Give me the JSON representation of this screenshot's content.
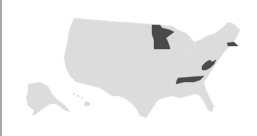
{
  "map": {
    "type": "choropleth",
    "region": "United States",
    "colors": {
      "background": "#ffffff",
      "default_state": "#dcdcdc",
      "highlighted_state": "#4a4a4a",
      "border": "#a8a8a8"
    },
    "highlighted_states": [
      "Minnesota",
      "Massachusetts",
      "West Virginia",
      "Tennessee"
    ],
    "insets": [
      "Alaska",
      "Hawaii"
    ]
  }
}
